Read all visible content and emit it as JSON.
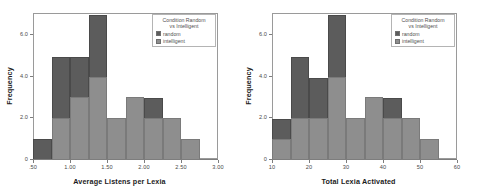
{
  "colors": {
    "random": "#5c5c5c",
    "intelligent": "#8e8e8e",
    "axis": "#7d7d7d",
    "frame": "#9a9a9a",
    "text": "#4a4a4a",
    "background": "#ffffff"
  },
  "legend": {
    "title_line1": "Condition  Random",
    "title_line2": "vs Intelligent",
    "items": [
      {
        "label": "random",
        "color": "#5c5c5c",
        "swatch": "dark"
      },
      {
        "label": "intelligent",
        "color": "#8e8e8e",
        "swatch": "light"
      }
    ]
  },
  "chart_data": [
    {
      "type": "bar",
      "subtype": "stacked-histogram",
      "title": "",
      "xlabel": "Average Listens per Lexia",
      "ylabel": "Frequency",
      "xlim": [
        0.5,
        3.0
      ],
      "ylim": [
        0,
        7
      ],
      "grid": false,
      "legend_position": "top-right",
      "xticks": [
        0.5,
        1.0,
        1.5,
        2.0,
        2.5,
        3.0
      ],
      "xticklabels": [
        ".50",
        "1.00",
        "1.50",
        "2.00",
        "2.50",
        "3.00"
      ],
      "yticks": [
        0,
        2,
        4,
        6
      ],
      "yticklabels": [
        "0",
        "2.0",
        "4.0",
        "6.0"
      ],
      "bin_width": 0.25,
      "bin_edges": [
        0.5,
        0.75,
        1.0,
        1.25,
        1.5,
        1.75,
        2.0,
        2.25,
        2.5,
        2.75
      ],
      "bin_labels": [
        "0.50-0.75",
        "0.75-1.00",
        "1.00-1.25",
        "1.25-1.50",
        "1.50-1.75",
        "1.75-2.00",
        "2.00-2.25",
        "2.25-2.50",
        "2.50-2.75"
      ],
      "series": [
        {
          "name": "intelligent",
          "color": "#8e8e8e",
          "values": [
            0,
            2,
            3,
            4,
            2,
            3,
            2,
            2,
            1
          ]
        },
        {
          "name": "random",
          "color": "#5c5c5c",
          "values": [
            1,
            3,
            2,
            3,
            0,
            0,
            1,
            0,
            0
          ]
        }
      ],
      "totals": [
        1,
        5,
        5,
        7,
        2,
        3,
        3,
        2,
        1
      ]
    },
    {
      "type": "bar",
      "subtype": "stacked-histogram",
      "title": "",
      "xlabel": "Total Lexia Activated",
      "ylabel": "Frequency",
      "xlim": [
        10,
        60
      ],
      "ylim": [
        0,
        7
      ],
      "grid": false,
      "legend_position": "top-right",
      "xticks": [
        10,
        20,
        30,
        40,
        50,
        60
      ],
      "xticklabels": [
        "10",
        "20",
        "30",
        "40",
        "50",
        "60"
      ],
      "yticks": [
        0,
        2,
        4,
        6
      ],
      "yticklabels": [
        "0",
        "2.0",
        "4.0",
        "6.0"
      ],
      "bin_width": 5,
      "bin_edges": [
        10,
        15,
        20,
        25,
        30,
        35,
        40,
        45,
        50,
        55
      ],
      "bin_labels": [
        "10-15",
        "15-20",
        "20-25",
        "25-30",
        "30-35",
        "35-40",
        "40-45",
        "45-50",
        "50-55"
      ],
      "series": [
        {
          "name": "intelligent",
          "color": "#8e8e8e",
          "values": [
            1,
            2,
            2,
            4,
            2,
            3,
            2,
            2,
            1
          ]
        },
        {
          "name": "random",
          "color": "#5c5c5c",
          "values": [
            1,
            3,
            2,
            3,
            0,
            0,
            1,
            0,
            0
          ]
        }
      ],
      "totals": [
        2,
        5,
        4,
        7,
        2,
        3,
        3,
        2,
        1
      ]
    }
  ]
}
